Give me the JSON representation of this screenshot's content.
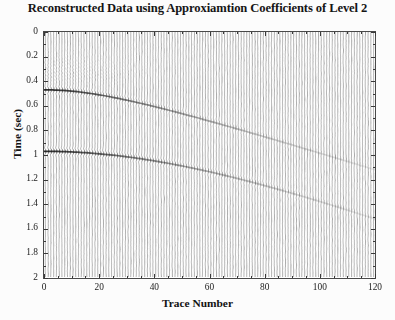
{
  "chart_data": {
    "type": "line",
    "render_style": "seismic-wiggle-variable-area",
    "title": "Reconstructed Data using Approxiamtion Coefficients of Level 2",
    "xlabel": "Trace Number",
    "ylabel": "Time (sec)",
    "xlim": [
      0,
      120
    ],
    "ylim": [
      0,
      2
    ],
    "y_inverted": true,
    "grid": false,
    "legend": null,
    "xticks": [
      0,
      20,
      40,
      60,
      80,
      100,
      120
    ],
    "xtick_labels": [
      "0",
      "20",
      "40",
      "60",
      "80",
      "100",
      "120"
    ],
    "x_minor_step": 5,
    "yticks": [
      0,
      0.2,
      0.4,
      0.6,
      0.8,
      1,
      1.2,
      1.4,
      1.6,
      1.8,
      2
    ],
    "ytick_labels": [
      "0",
      "0.2",
      "0.4",
      "0.6",
      "0.8",
      "1",
      "1.2",
      "1.4",
      "1.6",
      "1.8",
      "2"
    ],
    "n_traces": 120,
    "trace_spacing_units": 1,
    "time_samples": 250,
    "wiggle_color": "#6e6e6e",
    "fill_color": "#3a3a3a",
    "background_color": "#ffffff",
    "events": [
      {
        "name": "reflector-1",
        "t0_sec": 0.47,
        "apex_trace": 0,
        "t_at_trace_120_sec": 1.12,
        "moveout": "hyperbolic",
        "nmo_velocity_like": 2.25,
        "peak_amplitude": 1.0,
        "amplitude_decay_per_trace": 0.0172,
        "dominant_frequency_hz": 26,
        "polarity": "negative-then-positive"
      },
      {
        "name": "reflector-2",
        "t0_sec": 0.97,
        "apex_trace": 0,
        "t_at_trace_120_sec": 1.52,
        "moveout": "hyperbolic",
        "nmo_velocity_like": 3.1,
        "peak_amplitude": 1.0,
        "amplitude_decay_per_trace": 0.0138,
        "dominant_frequency_hz": 22,
        "polarity": "negative-then-positive"
      }
    ],
    "noise": {
      "background_rms": 0.085,
      "upper_left_dispersion_amplitude": 0.3,
      "upper_left_trace_extent": 42,
      "upper_left_time_range_sec": [
        0.12,
        0.52
      ]
    }
  },
  "axes": {
    "title": "Reconstructed Data using Approxiamtion Coefficients of Level 2",
    "x_title": "Trace Number",
    "y_title": "Time (sec)"
  }
}
